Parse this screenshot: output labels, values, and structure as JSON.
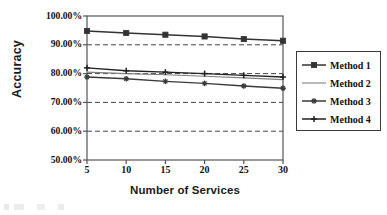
{
  "chart_data": {
    "type": "line",
    "title": "",
    "xlabel": "Number of Services",
    "ylabel": "Accuracy",
    "x": [
      5,
      10,
      15,
      20,
      25,
      30
    ],
    "xtick_labels": [
      "5",
      "10",
      "15",
      "20",
      "25",
      "30"
    ],
    "ytick_labels": [
      "100.00%",
      "90.00%",
      "80.00%",
      "70.00%",
      "60.00%",
      "50.00%"
    ],
    "ytick_values": [
      100,
      90,
      80,
      70,
      60,
      50
    ],
    "ylim": [
      50,
      100
    ],
    "xlim": [
      5,
      30
    ],
    "grid": "horizontal-dashed",
    "legend_position": "right-outside",
    "series": [
      {
        "name": "Method 1",
        "marker": "square",
        "values": [
          94.8,
          94.1,
          93.5,
          92.9,
          92.0,
          91.4
        ],
        "color": "#333333"
      },
      {
        "name": "Method 2",
        "marker": "none",
        "values": [
          80.5,
          80.0,
          79.6,
          79.1,
          78.5,
          77.9
        ],
        "color": "#808080"
      },
      {
        "name": "Method 3",
        "marker": "star",
        "values": [
          78.8,
          78.2,
          77.3,
          76.6,
          75.7,
          74.9
        ],
        "color": "#3a3a3a"
      },
      {
        "name": "Method 4",
        "marker": "plus",
        "values": [
          82.0,
          81.0,
          80.5,
          80.0,
          79.4,
          78.8
        ],
        "color": "#222222"
      }
    ]
  },
  "axes": {
    "y_title": "Accuracy",
    "x_title": "Number of Services"
  },
  "legend": {
    "entries": [
      {
        "label": "Method 1"
      },
      {
        "label": "Method 2"
      },
      {
        "label": "Method 3"
      },
      {
        "label": "Method 4"
      }
    ]
  },
  "colors": {
    "frame": "#555555",
    "grid": "#444444",
    "background": "#ffffff",
    "text": "#111111"
  }
}
